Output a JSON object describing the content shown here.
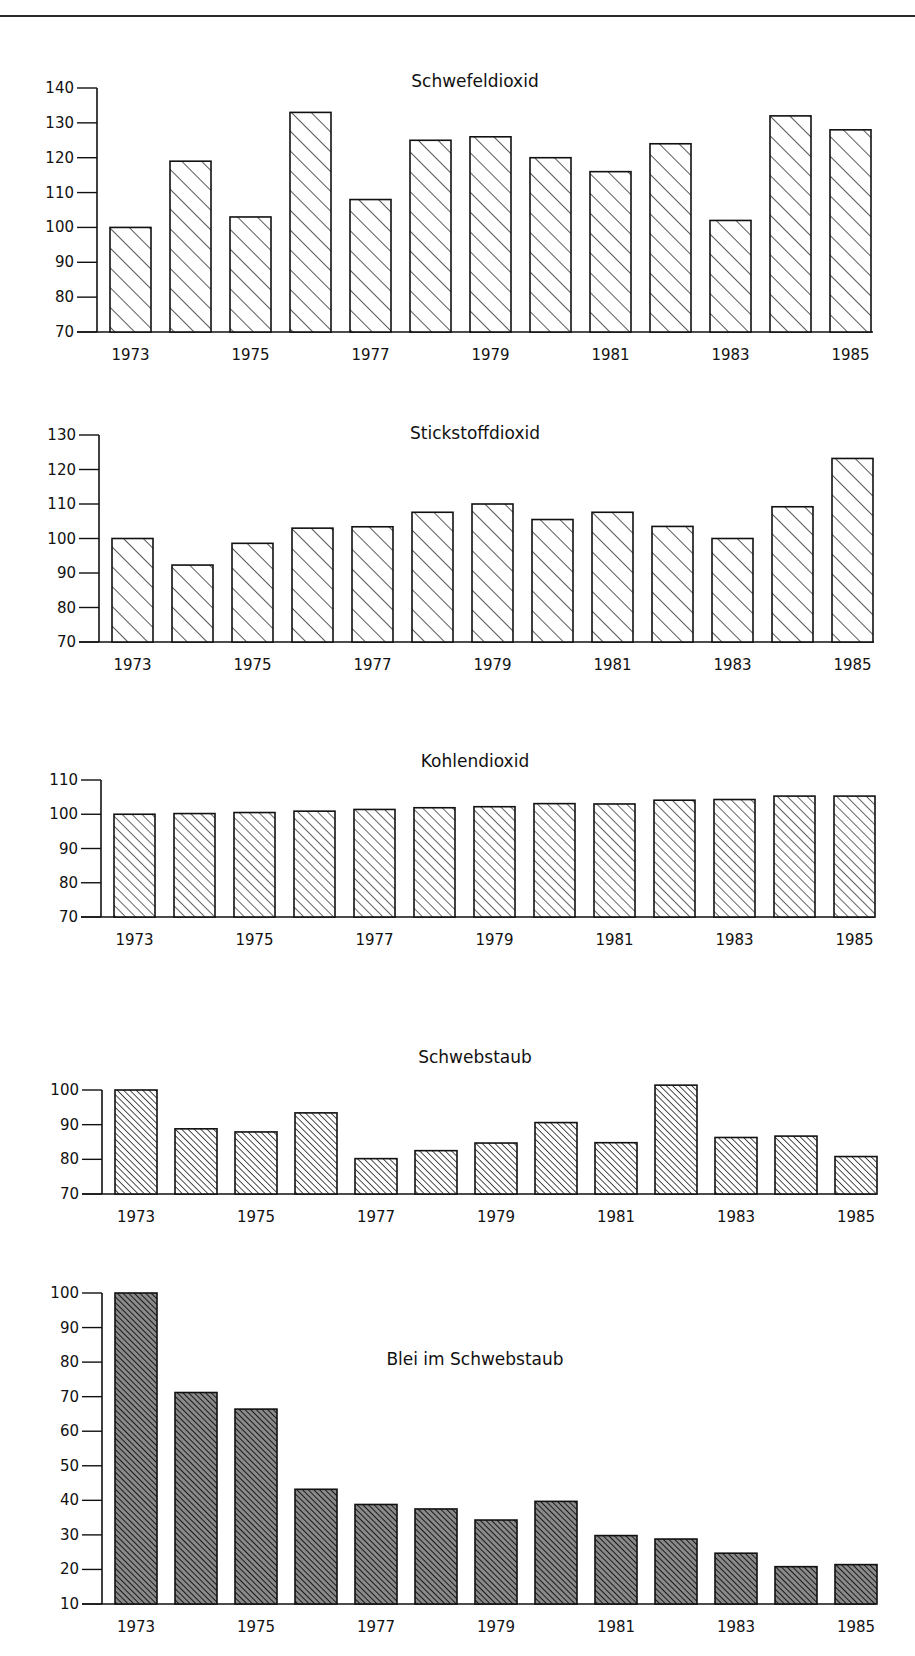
{
  "chart_data": [
    {
      "id": "so2",
      "type": "bar",
      "title": "Schwefeldioxid",
      "xlabel": "",
      "ylabel": "",
      "categories": [
        "1973",
        "1974",
        "1975",
        "1976",
        "1977",
        "1978",
        "1979",
        "1980",
        "1981",
        "1982",
        "1983",
        "1984",
        "1985"
      ],
      "x_tick_labels": [
        "1973",
        "1975",
        "1977",
        "1979",
        "1981",
        "1983",
        "1985"
      ],
      "values": [
        100,
        119,
        103,
        133,
        108,
        125,
        126,
        120,
        116,
        124,
        102,
        132,
        128
      ],
      "ylim": [
        70,
        140
      ],
      "yticks": [
        70,
        80,
        90,
        100,
        110,
        120,
        130,
        140
      ],
      "grid": false,
      "legend": null,
      "fill": "hatch-sparse",
      "layout": {
        "axis_x": 97,
        "baseline_y": 332,
        "top_y": 88,
        "title_x": 475,
        "title_y": 87,
        "first_bar_x": 110,
        "pitch": 60,
        "bar_w": 41,
        "axis_end_x": 873
      }
    },
    {
      "id": "no2",
      "type": "bar",
      "title": "Stickstoffdioxid",
      "xlabel": "",
      "ylabel": "",
      "categories": [
        "1973",
        "1974",
        "1975",
        "1976",
        "1977",
        "1978",
        "1979",
        "1980",
        "1981",
        "1982",
        "1983",
        "1984",
        "1985"
      ],
      "x_tick_labels": [
        "1973",
        "1975",
        "1977",
        "1979",
        "1981",
        "1983",
        "1985"
      ],
      "values": [
        100,
        92.3,
        98.6,
        103,
        103.4,
        107.6,
        110,
        105.5,
        107.6,
        103.5,
        100,
        109.2,
        123.2
      ],
      "ylim": [
        70,
        130
      ],
      "yticks": [
        70,
        80,
        90,
        100,
        110,
        120,
        130
      ],
      "grid": false,
      "legend": null,
      "fill": "hatch-sparse",
      "layout": {
        "axis_x": 99,
        "baseline_y": 642,
        "top_y": 435,
        "title_x": 475,
        "title_y": 439,
        "first_bar_x": 112,
        "pitch": 60,
        "bar_w": 41,
        "axis_end_x": 874
      }
    },
    {
      "id": "co2",
      "type": "bar",
      "title": "Kohlendioxid",
      "xlabel": "",
      "ylabel": "",
      "categories": [
        "1973",
        "1974",
        "1975",
        "1976",
        "1977",
        "1978",
        "1979",
        "1980",
        "1981",
        "1982",
        "1983",
        "1984",
        "1985"
      ],
      "x_tick_labels": [
        "1973",
        "1975",
        "1977",
        "1979",
        "1981",
        "1983",
        "1985"
      ],
      "values": [
        100,
        100.2,
        100.5,
        100.9,
        101.4,
        101.9,
        102.2,
        103.1,
        103,
        104.1,
        104.3,
        105.3,
        105.3
      ],
      "ylim": [
        70,
        110
      ],
      "yticks": [
        70,
        80,
        90,
        100,
        110
      ],
      "grid": false,
      "legend": null,
      "fill": "hatch-medium",
      "layout": {
        "axis_x": 101,
        "baseline_y": 917,
        "top_y": 780,
        "title_x": 475,
        "title_y": 767,
        "first_bar_x": 114,
        "pitch": 60,
        "bar_w": 41,
        "axis_end_x": 875
      }
    },
    {
      "id": "schwebstaub",
      "type": "bar",
      "title": "Schwebstaub",
      "xlabel": "",
      "ylabel": "",
      "categories": [
        "1973",
        "1974",
        "1975",
        "1976",
        "1977",
        "1978",
        "1979",
        "1980",
        "1981",
        "1982",
        "1983",
        "1984",
        "1985"
      ],
      "x_tick_labels": [
        "1973",
        "1975",
        "1977",
        "1979",
        "1981",
        "1983",
        "1985"
      ],
      "values": [
        100,
        88.8,
        87.9,
        93.4,
        80.2,
        82.5,
        84.7,
        90.6,
        84.8,
        101.4,
        86.3,
        86.7,
        80.8
      ],
      "ylim": [
        70,
        100
      ],
      "yticks": [
        70,
        80,
        90,
        100
      ],
      "grid": false,
      "legend": null,
      "fill": "hatch-dense",
      "layout": {
        "axis_x": 102,
        "baseline_y": 1194,
        "top_y": 1090,
        "title_x": 475,
        "title_y": 1063,
        "first_bar_x": 115,
        "pitch": 60,
        "bar_w": 42,
        "axis_end_x": 876
      }
    },
    {
      "id": "blei",
      "type": "bar",
      "title": "Blei im Schwebstaub",
      "xlabel": "",
      "ylabel": "",
      "categories": [
        "1973",
        "1974",
        "1975",
        "1976",
        "1977",
        "1978",
        "1979",
        "1980",
        "1981",
        "1982",
        "1983",
        "1984",
        "1985"
      ],
      "x_tick_labels": [
        "1973",
        "1975",
        "1977",
        "1979",
        "1981",
        "1983",
        "1985"
      ],
      "values": [
        100,
        71.2,
        66.4,
        43.2,
        38.8,
        37.5,
        34.3,
        39.7,
        29.8,
        28.8,
        24.7,
        20.8,
        21.4
      ],
      "ylim": [
        10,
        100
      ],
      "yticks": [
        10,
        20,
        30,
        40,
        50,
        60,
        70,
        80,
        90,
        100
      ],
      "grid": false,
      "legend": null,
      "fill": "hatch-dark",
      "layout": {
        "axis_x": 102,
        "baseline_y": 1604,
        "top_y": 1293,
        "title_x": 475,
        "title_y": 1365,
        "first_bar_x": 115,
        "pitch": 60,
        "bar_w": 42,
        "axis_end_x": 876
      }
    }
  ]
}
